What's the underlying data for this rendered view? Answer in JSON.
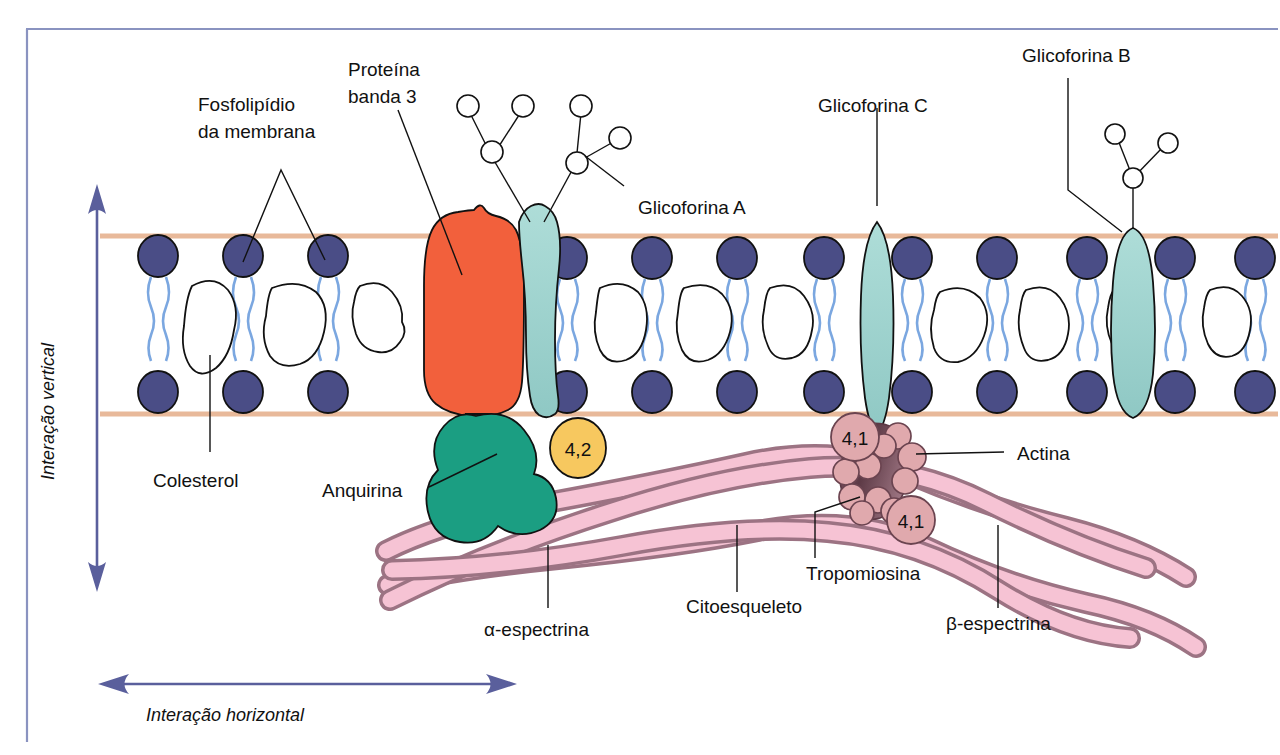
{
  "figure": {
    "language": "pt-BR",
    "frame_color": "#8a93c0",
    "background": "#ffffff"
  },
  "colors": {
    "band3": "#f2603c",
    "glycophorin": "#9fd4d0",
    "phospholipid_head": "#4a4d86",
    "phospholipid_tail": "#7ba7e0",
    "cholesterol": "#ffffff",
    "ankyrin": "#1b9e82",
    "protein_42": "#f7c85f",
    "spectrin_fill": "#f6c3d4",
    "spectrin_stroke": "#9c7383",
    "actin_core": "#6b4450",
    "actin_bead": "#e0a9ad",
    "membrane_line": "#e8b99a",
    "arrow": "#5a5f9c",
    "text": "#111111"
  },
  "labels": {
    "phospholipid": {
      "line1": "Fosfolipídio",
      "line2": "da membrana"
    },
    "band3": {
      "line1": "Proteína",
      "line2": "banda 3"
    },
    "glycophorin_a": "Glicoforina A",
    "glycophorin_b": "Glicoforina B",
    "glycophorin_c": "Glicoforina C",
    "cholesterol": "Colesterol",
    "ankyrin": "Anquirina",
    "protein_42": "4,2",
    "protein_41_upper": "4,1",
    "protein_41_lower": "4,1",
    "actin": "Actina",
    "tropomyosin": "Tropomiosina",
    "cytoskeleton": "Citoesqueleto",
    "alpha_spectrin": "α-espectrina",
    "beta_spectrin": "β-espectrina",
    "vertical_interaction": "Interação vertical",
    "horizontal_interaction": "Interação horizontal"
  },
  "membrane": {
    "outer_leaflet_y": 236,
    "inner_leaflet_y": 414,
    "phospholipid_count_outer": 13,
    "phospholipid_count_inner": 13,
    "cholesterol_count": 10
  },
  "icons": {
    "vertical_arrow": "double-headed-vertical-arrow",
    "horizontal_arrow": "double-headed-horizontal-arrow",
    "sugar_node": "glycan-circle"
  }
}
